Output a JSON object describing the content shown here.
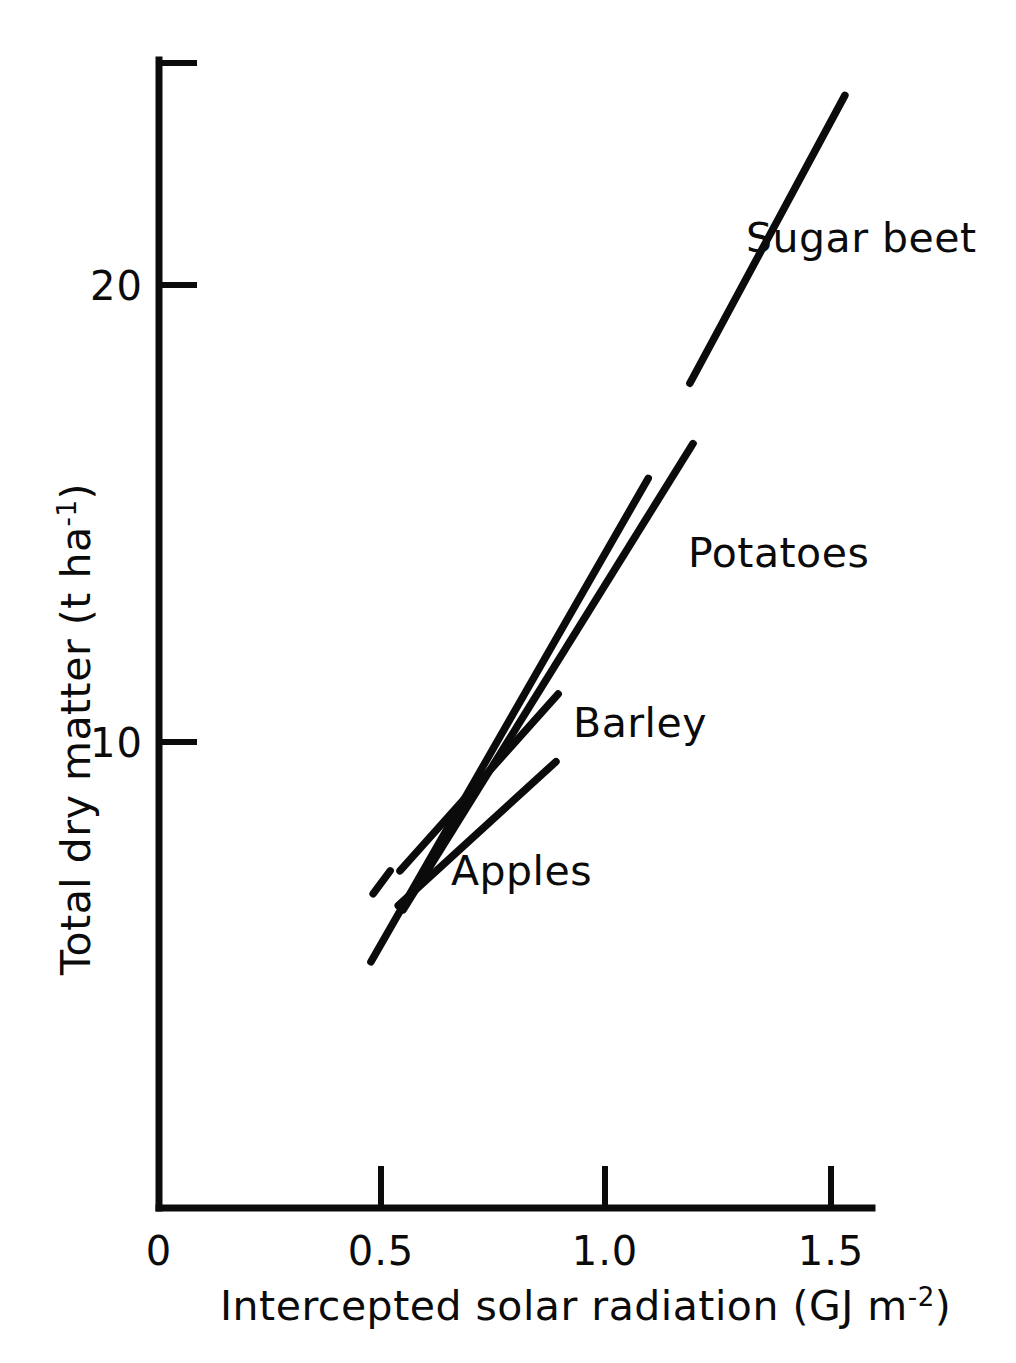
{
  "chart_data": {
    "type": "line",
    "title": "",
    "xlabel": "Intercepted solar radiation (GJ m-2)",
    "xlabel_main": "Intercepted solar radiation (GJ m",
    "xlabel_exponent": "-2",
    "xlabel_tail": ")",
    "ylabel": "Total dry matter (t ha-1)",
    "ylabel_main": "Total dry matter (t ha",
    "ylabel_exponent": "-1",
    "ylabel_tail": ")",
    "xlim": [
      0,
      1.63
    ],
    "ylim": [
      0,
      25.1
    ],
    "grid": false,
    "legend_position": "inline-annotations",
    "x_ticks": [
      {
        "value": 0,
        "label": "0"
      },
      {
        "value": 0.5,
        "label": "0.5"
      },
      {
        "value": 1.0,
        "label": "1.0"
      },
      {
        "value": 1.5,
        "label": "1.5"
      }
    ],
    "y_ticks": [
      {
        "value": 10,
        "label": "10"
      },
      {
        "value": 20,
        "label": "20"
      }
    ],
    "series": [
      {
        "name": "Sugar beet",
        "label": "Sugar beet",
        "color": "#0b0b0b",
        "segments": [
          {
            "x": [
              0.478,
              0.516
            ],
            "y": [
              6.68,
              7.18
            ]
          },
          {
            "x": [
              0.473,
              1.092
            ],
            "y": [
              5.19,
              15.77
            ]
          },
          {
            "x": [
              1.185,
              1.531
            ],
            "y": [
              17.85,
              24.15
            ]
          }
        ],
        "slope_t_per_GJ": 17.1
      },
      {
        "name": "Potatoes",
        "label": "Potatoes",
        "color": "#0b0b0b",
        "segments": [
          {
            "x": [
              0.545,
              1.192
            ],
            "y": [
              6.33,
              16.53
            ]
          }
        ],
        "slope_t_per_GJ": 15.8
      },
      {
        "name": "Barley",
        "label": "Barley",
        "color": "#0b0b0b",
        "segments": [
          {
            "x": [
              0.538,
              0.891
            ],
            "y": [
              7.18,
              11.05
            ]
          }
        ],
        "slope_t_per_GJ": 11.0
      },
      {
        "name": "Apples",
        "label": "Apples",
        "color": "#0b0b0b",
        "segments": [
          {
            "x": [
              0.534,
              0.886
            ],
            "y": [
              6.42,
              9.57
            ]
          }
        ],
        "slope_t_per_GJ": 9.0
      }
    ],
    "annotations": [
      {
        "text": "Sugar beet",
        "x": 1.31,
        "y": 20.9
      },
      {
        "text": "Potatoes",
        "x": 1.18,
        "y": 14.4
      },
      {
        "text": "Barley",
        "x": 0.93,
        "y": 10.8
      },
      {
        "text": "Apples",
        "x": 0.7,
        "y": 8.0
      }
    ]
  },
  "axis_titles": {
    "x": "Intercepted solar radiation (GJ m-2)",
    "y": "Total dry matter (t ha-1)"
  }
}
